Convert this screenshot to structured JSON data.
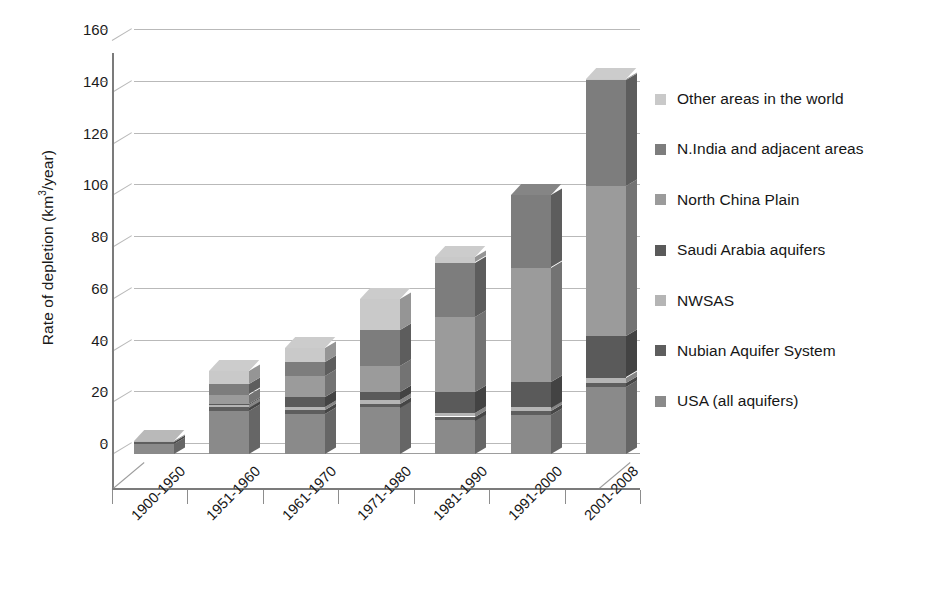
{
  "chart_data": {
    "type": "bar",
    "subtype": "stacked-3d-column",
    "title": "",
    "xlabel": "",
    "ylabel": "Rate of depletion (km3/year)",
    "ylabel_html": "Rate of depletion (km<sup>3</sup>/year)",
    "ylim": [
      0,
      160
    ],
    "ytick_step": 20,
    "ytick_labels": [
      "160",
      "140",
      "120",
      "100",
      "80",
      "60",
      "40",
      "20",
      "0"
    ],
    "ytick_values": [
      160,
      140,
      120,
      100,
      80,
      60,
      40,
      20,
      0
    ],
    "grid": true,
    "legend_position": "right",
    "categories": [
      "1900-1950",
      "1951-1960",
      "1961-1970",
      "1971-1980",
      "1981-1990",
      "1991-2000",
      "2001-2008"
    ],
    "series": [
      {
        "name": "USA (all aquifers)",
        "color": "#8a8a8a",
        "values": [
          4.0,
          16.5,
          15.5,
          18.0,
          13.0,
          15.0,
          26.0
        ]
      },
      {
        "name": "Nubian Aquifer System",
        "color": "#5e5e5e",
        "values": [
          0.8,
          1.5,
          1.5,
          1.5,
          1.5,
          1.5,
          1.5
        ]
      },
      {
        "name": "NWSAS",
        "color": "#b5b5b5",
        "values": [
          0.4,
          1.0,
          1.0,
          1.5,
          1.5,
          1.5,
          2.0
        ]
      },
      {
        "name": "Saudi Arabia aquifers",
        "color": "#5a5a5a",
        "values": [
          0.0,
          0.5,
          4.0,
          3.0,
          8.0,
          10.0,
          16.0
        ]
      },
      {
        "name": "North China Plain",
        "color": "#9b9b9b",
        "values": [
          0.0,
          3.5,
          8.0,
          10.0,
          29.0,
          44.0,
          58.0
        ]
      },
      {
        "name": "N.India and adjacent areas",
        "color": "#7d7d7d",
        "values": [
          0.0,
          4.0,
          5.5,
          14.0,
          21.0,
          28.0,
          41.0
        ]
      },
      {
        "name": "Other areas in the world",
        "color": "#c9c9c9",
        "values": [
          0.0,
          5.0,
          5.5,
          12.0,
          2.0,
          0.0,
          0.5
        ]
      }
    ],
    "totals": [
      5.2,
      32.0,
      41.0,
      60.0,
      76.0,
      100.0,
      145.0
    ]
  },
  "legend": {
    "items": [
      {
        "label": "Other areas in the world",
        "swatch": "#c9c9c9"
      },
      {
        "label": "N.India and adjacent areas",
        "swatch": "#7d7d7d"
      },
      {
        "label": "North China Plain",
        "swatch": "#9b9b9b"
      },
      {
        "label": "Saudi Arabia aquifers",
        "swatch": "#5a5a5a"
      },
      {
        "label": "NWSAS",
        "swatch": "#b5b5b5"
      },
      {
        "label": "Nubian Aquifer System",
        "swatch": "#5e5e5e"
      },
      {
        "label": "USA (all aquifers)",
        "swatch": "#8a8a8a"
      }
    ]
  },
  "axis": {
    "y_title": "Rate of depletion (km3/year)",
    "y_title_prefix": "Rate of depletion (km",
    "y_title_sup": "3",
    "y_title_suffix": "/year)"
  },
  "colors": {
    "gridline": "#b9b9b9",
    "axis": "#7b7b7b",
    "text": "#191919",
    "bar_side_darken": "rgba(0,0,0,0.26)",
    "bar_top_lighten": "rgba(255,255,255,0.12)"
  }
}
